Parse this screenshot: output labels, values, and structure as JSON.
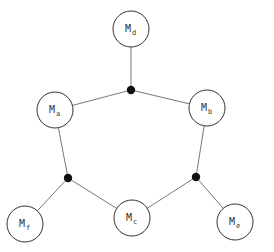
{
  "diagram": {
    "type": "graph",
    "nodes": [
      {
        "id": "Md",
        "main": "M",
        "sub": "d",
        "x": 131,
        "y": 29
      },
      {
        "id": "Ma",
        "main": "M",
        "sub": "a",
        "x": 55,
        "y": 110
      },
      {
        "id": "Mb",
        "main": "M",
        "sub": "b",
        "x": 207,
        "y": 108
      },
      {
        "id": "Mf",
        "main": "M",
        "sub": "f",
        "x": 25,
        "y": 224
      },
      {
        "id": "Mc",
        "main": "M",
        "sub": "c",
        "x": 132,
        "y": 218
      },
      {
        "id": "Me",
        "main": "M",
        "sub": "e",
        "x": 235,
        "y": 222
      }
    ],
    "junctions": [
      {
        "id": "J1",
        "x": 131,
        "y": 90
      },
      {
        "id": "J2",
        "x": 68,
        "y": 178
      },
      {
        "id": "J3",
        "x": 196,
        "y": 177
      }
    ],
    "edges": [
      [
        "J1",
        "Md"
      ],
      [
        "J1",
        "Ma"
      ],
      [
        "J1",
        "Mb"
      ],
      [
        "J2",
        "Ma"
      ],
      [
        "J2",
        "Mf"
      ],
      [
        "J2",
        "Mc"
      ],
      [
        "J3",
        "Mb"
      ],
      [
        "J3",
        "Mc"
      ],
      [
        "J3",
        "Me"
      ]
    ],
    "colors": {
      "line": "#555555",
      "node_stroke": "#333333",
      "junction": "#111111",
      "background": "#ffffff"
    }
  }
}
